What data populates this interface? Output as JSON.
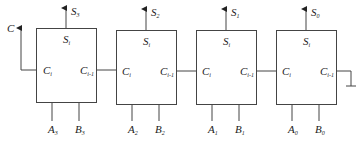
{
  "diagram": {
    "carry_out_label": "C",
    "ground_label": "",
    "stages": [
      {
        "sum_out": "S",
        "sum_out_sub": "3",
        "sum_pin": "S",
        "sum_pin_sub": "i",
        "cin_pin": "C",
        "cin_pin_sub": "i",
        "cout_pin": "C",
        "cout_pin_sub": "i-1",
        "a": "A",
        "a_sub": "3",
        "b": "B",
        "b_sub": "3"
      },
      {
        "sum_out": "S",
        "sum_out_sub": "2",
        "sum_pin": "S",
        "sum_pin_sub": "i",
        "cin_pin": "C",
        "cin_pin_sub": "i",
        "cout_pin": "C",
        "cout_pin_sub": "i-1",
        "a": "A",
        "a_sub": "2",
        "b": "B",
        "b_sub": "2"
      },
      {
        "sum_out": "S",
        "sum_out_sub": "1",
        "sum_pin": "S",
        "sum_pin_sub": "i",
        "cin_pin": "C",
        "cin_pin_sub": "i",
        "cout_pin": "C",
        "cout_pin_sub": "i-1",
        "a": "A",
        "a_sub": "1",
        "b": "B",
        "b_sub": "1"
      },
      {
        "sum_out": "S",
        "sum_out_sub": "0",
        "sum_pin": "S",
        "sum_pin_sub": "i",
        "cin_pin": "C",
        "cin_pin_sub": "i",
        "cout_pin": "C",
        "cout_pin_sub": "i-1",
        "a": "A",
        "a_sub": "0",
        "b": "B",
        "b_sub": "0"
      }
    ]
  }
}
